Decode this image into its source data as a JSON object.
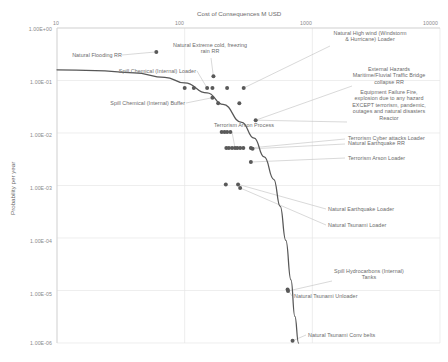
{
  "chart_data": {
    "type": "scatter",
    "title": "",
    "xlabel": "Cost of Consequences M USD",
    "ylabel": "Probability per year",
    "xscale": "log",
    "yscale": "log",
    "xlim": [
      10,
      10000
    ],
    "ylim": [
      1e-06,
      1
    ],
    "xticks": [
      "10",
      "100",
      "1000",
      "10000"
    ],
    "yticks": [
      "1.00E+00",
      "1.00E-01",
      "1.00E-02",
      "1.00E-03",
      "1.00E-04",
      "1.00E-05",
      "1.00E-06"
    ],
    "grid": true,
    "legend": "none",
    "marker_color": "#595959",
    "curve_color": "#575757",
    "leader_color": "#bfbfbf",
    "curve_note": "Risk acceptance / tolerability F-N curve descending from upper-left to lower-right",
    "curve_points": [
      {
        "x": 10,
        "y": 0.16
      },
      {
        "x": 20,
        "y": 0.155
      },
      {
        "x": 40,
        "y": 0.14
      },
      {
        "x": 70,
        "y": 0.115
      },
      {
        "x": 100,
        "y": 0.09
      },
      {
        "x": 150,
        "y": 0.058
      },
      {
        "x": 200,
        "y": 0.035
      },
      {
        "x": 280,
        "y": 0.016
      },
      {
        "x": 350,
        "y": 0.008
      },
      {
        "x": 420,
        "y": 0.0035
      },
      {
        "x": 500,
        "y": 0.0013
      },
      {
        "x": 560,
        "y": 0.0004
      },
      {
        "x": 620,
        "y": 9e-05
      },
      {
        "x": 680,
        "y": 1.6e-05
      },
      {
        "x": 730,
        "y": 3.2e-06
      },
      {
        "x": 780,
        "y": 1e-06
      }
    ],
    "points": [
      {
        "x": 60,
        "y": 0.35,
        "label": "Natural Flooding RR"
      },
      {
        "x": 100,
        "y": 0.072,
        "label": ""
      },
      {
        "x": 118,
        "y": 0.072,
        "label": ""
      },
      {
        "x": 150,
        "y": 0.072,
        "label": "Spill Chemical (Internal) Loader"
      },
      {
        "x": 165,
        "y": 0.072,
        "label": ""
      },
      {
        "x": 165,
        "y": 0.047,
        "label": "Spill Chemical (Internal) Buffer"
      },
      {
        "x": 183,
        "y": 0.037,
        "label": ""
      },
      {
        "x": 168,
        "y": 0.12,
        "label": "Natural Extreme cold, freezing rain RR"
      },
      {
        "x": 215,
        "y": 0.072,
        "label": ""
      },
      {
        "x": 290,
        "y": 0.072,
        "label": "Natural High wind (Windstorm & Hurricane) Loader"
      },
      {
        "x": 268,
        "y": 0.037,
        "label": ""
      },
      {
        "x": 360,
        "y": 0.0175,
        "label": "External Hazards Maritime/Fluvial Traffic Bridge collapse RR"
      },
      {
        "x": 195,
        "y": 0.0105,
        "label": ""
      },
      {
        "x": 205,
        "y": 0.0105,
        "label": ""
      },
      {
        "x": 215,
        "y": 0.0105,
        "label": ""
      },
      {
        "x": 228,
        "y": 0.0105,
        "label": ""
      },
      {
        "x": 212,
        "y": 0.0052,
        "label": ""
      },
      {
        "x": 222,
        "y": 0.0052,
        "label": ""
      },
      {
        "x": 235,
        "y": 0.0052,
        "label": ""
      },
      {
        "x": 248,
        "y": 0.0052,
        "label": "Terrorism Arson Process"
      },
      {
        "x": 258,
        "y": 0.0052,
        "label": ""
      },
      {
        "x": 272,
        "y": 0.0052,
        "label": ""
      },
      {
        "x": 288,
        "y": 0.0052,
        "label": ""
      },
      {
        "x": 330,
        "y": 0.0052,
        "label": "Terrorism Cyber attacks Loader"
      },
      {
        "x": 340,
        "y": 0.005,
        "label": "Natural Earthquake RR"
      },
      {
        "x": 330,
        "y": 0.0028,
        "label": "Terrorism Arson Loader"
      },
      {
        "x": 210,
        "y": 0.00105,
        "label": ""
      },
      {
        "x": 262,
        "y": 0.00105,
        "label": "Natural Earthquake Loader"
      },
      {
        "x": 272,
        "y": 0.0009,
        "label": "Natural Tsunami Loader"
      },
      {
        "x": 640,
        "y": 1.05e-05,
        "label": "Natural Tsunami Unloader"
      },
      {
        "x": 645,
        "y": 9.8e-06,
        "label": "Spill Hydrocarbons (Internal) Tanks"
      },
      {
        "x": 700,
        "y": 1.1e-06,
        "label": "Natural Tsunami Conv belts"
      }
    ],
    "annotations": [
      {
        "name": "natural-flooding-rr",
        "text": "Natural Flooding RR"
      },
      {
        "name": "natural-extreme-cold",
        "text": "Natural Extreme cold, freezing\nrain RR"
      },
      {
        "name": "natural-high-wind",
        "text": "Natural High wind (Windstorm\n& Hurricane) Loader"
      },
      {
        "name": "spill-chemical-loader",
        "text": "Spill Chemical (Internal) Loader"
      },
      {
        "name": "spill-chemical-buffer",
        "text": "Spill Chemical (Internal) Buffer"
      },
      {
        "name": "external-hazards-bridge",
        "text": "External Hazards\nMaritime/Fluvial Traffic Bridge\ncollapse RR"
      },
      {
        "name": "equipment-failure-fire",
        "text": "Equipment Failure Fire,\nexplosion due to any hazard\nEXCEPT terrorism, pandemic,\noutages and natural disasters\nReactor"
      },
      {
        "name": "terrorism-arson-process",
        "text": "Terrorism Arson Process"
      },
      {
        "name": "terrorism-cyber-attacks-loader",
        "text": "Terrorism Cyber attacks Loader"
      },
      {
        "name": "natural-earthquake-rr",
        "text": "Natural Earthquake RR"
      },
      {
        "name": "terrorism-arson-loader",
        "text": "Terrorism Arson Loader"
      },
      {
        "name": "natural-earthquake-loader",
        "text": "Natural Earthquake Loader"
      },
      {
        "name": "natural-tsunami-loader",
        "text": "Natural Tsunami Loader"
      },
      {
        "name": "spill-hydrocarbons-tanks",
        "text": "Spill Hydrocarbons (Internal)\nTanks"
      },
      {
        "name": "natural-tsunami-unloader",
        "text": "Natural Tsunami Unloader"
      },
      {
        "name": "natural-tsunami-conv-belts",
        "text": "Natural Tsunami Conv belts"
      }
    ]
  },
  "axes": {
    "x_title": "Cost of Consequences M USD",
    "y_title": "Probability per year",
    "x_tick_10": "10",
    "x_tick_100": "100",
    "x_tick_1000": "1000",
    "x_tick_10000": "10000",
    "y_tick_0": "1.00E+00",
    "y_tick_1": "1.00E-01",
    "y_tick_2": "1.00E-02",
    "y_tick_3": "1.00E-03",
    "y_tick_4": "1.00E-04",
    "y_tick_5": "1.00E-05",
    "y_tick_6": "1.00E-06"
  },
  "labels": {
    "natural_flooding_rr": "Natural Flooding RR",
    "natural_extreme_cold": "Natural Extreme cold, freezing\nrain RR",
    "natural_high_wind": "Natural High wind (Windstorm\n& Hurricane) Loader",
    "spill_chemical_loader": "Spill Chemical (Internal) Loader",
    "spill_chemical_buffer": "Spill Chemical (Internal) Buffer",
    "external_hazards_bridge": "External Hazards\nMaritime/Fluvial Traffic Bridge\ncollapse RR",
    "equipment_failure_fire": "Equipment Failure Fire,\nexplosion due to any hazard\nEXCEPT terrorism, pandemic,\noutages and natural disasters\nReactor",
    "terrorism_arson_process": "Terrorism Arson Process",
    "terrorism_cyber_attacks_loader": "Terrorism Cyber attacks Loader",
    "natural_earthquake_rr": "Natural Earthquake RR",
    "terrorism_arson_loader": "Terrorism Arson Loader",
    "natural_earthquake_loader": "Natural Earthquake Loader",
    "natural_tsunami_loader": "Natural Tsunami Loader",
    "spill_hydrocarbons_tanks": "Spill Hydrocarbons (Internal)\nTanks",
    "natural_tsunami_unloader": "Natural Tsunami Unloader",
    "natural_tsunami_conv_belts": "Natural Tsunami Conv belts"
  }
}
